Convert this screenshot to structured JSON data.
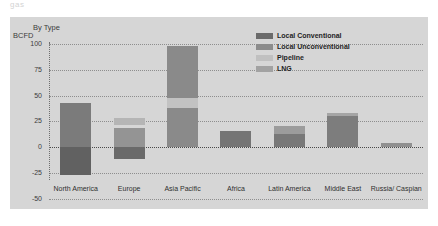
{
  "topstrip": {
    "ghost_text": "gas"
  },
  "chart_data": {
    "type": "bar",
    "stacked": true,
    "title": "By Type",
    "subtitle": "",
    "xlabel": "",
    "ylabel": "BCFD",
    "ylim": [
      -50,
      100
    ],
    "yticks": [
      100,
      75,
      50,
      25,
      0,
      -25,
      -50
    ],
    "ytick_labels": [
      "100",
      "75",
      "50",
      "25",
      "0",
      "-25",
      "-50"
    ],
    "grid": true,
    "zero_line": true,
    "legend_position": "top-right",
    "categories": [
      "North America",
      "Europe",
      "Asia Pacific",
      "Africa",
      "Latin America",
      "Middle East",
      "Russia/ Caspian"
    ],
    "series": [
      {
        "name": "Local Conventional",
        "color": "#6e6e6e",
        "values": [
          -27,
          -12,
          38,
          16,
          13,
          33,
          4
        ]
      },
      {
        "name": "Local Unconventional",
        "color": "#868686",
        "values": [
          43,
          0,
          0,
          0,
          0,
          0,
          0
        ]
      },
      {
        "name": "Pipeline",
        "color": "#a8a8a8",
        "values": [
          0,
          16,
          10,
          0,
          7,
          0,
          0
        ]
      },
      {
        "name": "LNG",
        "color": "#bdbdbd",
        "values": [
          0,
          10,
          50,
          0,
          0,
          0,
          0
        ]
      }
    ],
    "bar_segments": [
      {
        "category": "North America",
        "segments": [
          {
            "series": "Local Unconventional",
            "from": 0,
            "to": 43,
            "color": "#7b7b7b"
          },
          {
            "series": "Local Conventional",
            "from": -27,
            "to": 0,
            "color": "#616161"
          }
        ]
      },
      {
        "category": "Europe",
        "segments": [
          {
            "series": "LNG",
            "from": 21,
            "to": 28,
            "color": "#b5b5b5"
          },
          {
            "series": "Pipeline",
            "from": 0,
            "to": 18,
            "color": "#949494"
          },
          {
            "series": "Local Conventional",
            "from": -12,
            "to": 0,
            "color": "#6a6a6a"
          }
        ]
      },
      {
        "category": "Asia Pacific",
        "segments": [
          {
            "series": "LNG",
            "from": 48,
            "to": 98,
            "color": "#8a8a8a"
          },
          {
            "series": "Pipeline",
            "from": 38,
            "to": 48,
            "color": "#c2c2c2"
          },
          {
            "series": "Local Conventional",
            "from": 0,
            "to": 38,
            "color": "#8a8a8a"
          }
        ]
      },
      {
        "category": "Africa",
        "segments": [
          {
            "series": "Local Conventional",
            "from": 0,
            "to": 16,
            "color": "#757575"
          }
        ]
      },
      {
        "category": "Latin America",
        "segments": [
          {
            "series": "Pipeline",
            "from": 13,
            "to": 20,
            "color": "#9c9c9c"
          },
          {
            "series": "Local Conventional",
            "from": 0,
            "to": 13,
            "color": "#787878"
          }
        ]
      },
      {
        "category": "Middle East",
        "segments": [
          {
            "series": "LNG",
            "from": 30,
            "to": 33,
            "color": "#a5a5a5"
          },
          {
            "series": "Local Conventional",
            "from": 0,
            "to": 30,
            "color": "#7d7d7d"
          }
        ]
      },
      {
        "category": "Russia/ Caspian",
        "segments": [
          {
            "series": "Local Conventional",
            "from": 0,
            "to": 4,
            "color": "#909090"
          }
        ]
      }
    ]
  },
  "legend": {
    "items": [
      {
        "label": "Local Conventional",
        "color": "#6b6b6b"
      },
      {
        "label": "Local Unconventional",
        "color": "#8c8c8c"
      },
      {
        "label": "Pipeline",
        "color": "#c0c0c0"
      },
      {
        "label": "LNG",
        "color": "#a2a2a2"
      }
    ]
  },
  "theme": {
    "page_background": "#ffffff",
    "panel_background": "#d6d6d6",
    "text_color": "#2f2f2f",
    "grid_color": "#8e8e8e"
  }
}
